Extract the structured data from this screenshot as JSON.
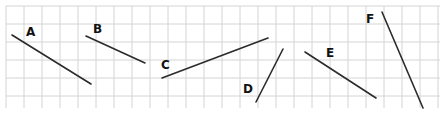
{
  "diagram": {
    "grid": {
      "x_start": 6,
      "y_start": 6,
      "x_end": 440,
      "y_end": 108,
      "cell_size": 18,
      "line_color": "#d4d4d4",
      "background": "#ffffff"
    },
    "segment_color": "#2b2b2b",
    "label_color": "#111111",
    "segments": [
      {
        "label": "A",
        "x1": 12,
        "y1": 35,
        "x2": 91,
        "y2": 84,
        "label_x": 26,
        "label_y": 36
      },
      {
        "label": "B",
        "x1": 86,
        "y1": 36,
        "x2": 145,
        "y2": 63,
        "label_x": 93,
        "label_y": 33
      },
      {
        "label": "C",
        "x1": 162,
        "y1": 78,
        "x2": 268,
        "y2": 38,
        "label_x": 161,
        "label_y": 69
      },
      {
        "label": "D",
        "x1": 256,
        "y1": 102,
        "x2": 283,
        "y2": 49,
        "label_x": 243,
        "label_y": 93
      },
      {
        "label": "E",
        "x1": 305,
        "y1": 52,
        "x2": 376,
        "y2": 98,
        "label_x": 326,
        "label_y": 57
      },
      {
        "label": "F",
        "x1": 382,
        "y1": 12,
        "x2": 423,
        "y2": 108,
        "label_x": 366,
        "label_y": 23
      }
    ]
  }
}
